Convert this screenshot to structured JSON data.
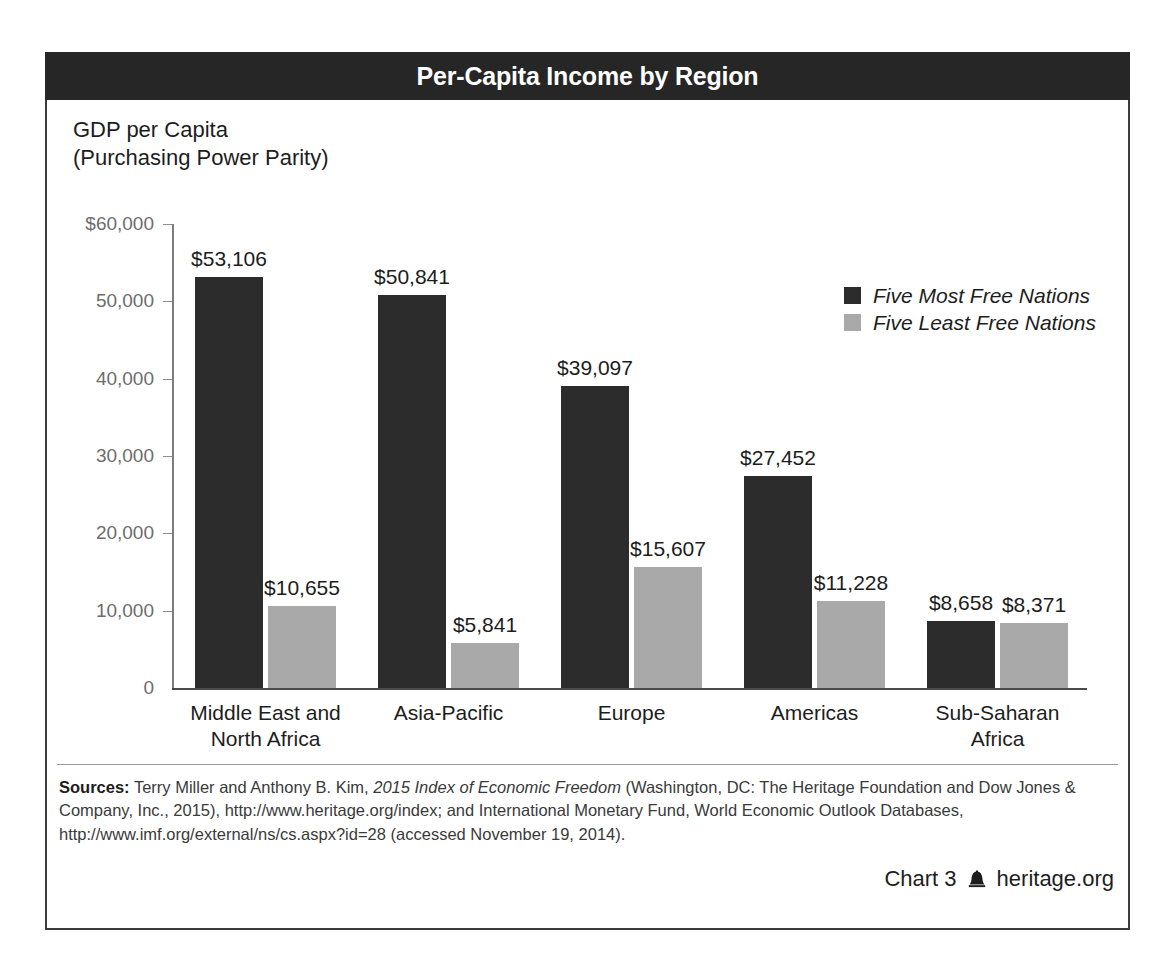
{
  "title": "Per-Capita Income by Region",
  "axis_title_line1": "GDP per Capita",
  "axis_title_line2": "(Purchasing Power Parity)",
  "legend": {
    "series1": "Five Most Free Nations",
    "series2": "Five Least Free Nations",
    "color1": "#2c2c2c",
    "color2": "#a9a9a9"
  },
  "footer": {
    "sources_label": "Sources:",
    "sources_text_1": " Terry Miller and Anthony B. Kim, ",
    "sources_italic_1": "2015 Index of Economic Freedom",
    "sources_text_2": " (Washington, DC: The Heritage Foundation and Dow Jones & Company, Inc., 2015), http://www.heritage.org/index; and International Monetary Fund, World Economic Outlook Databases, http://www.imf.org/external/ns/cs.aspx?id=28 (accessed November 19, 2014).",
    "chart_number": "Chart 3",
    "bell_icon": "liberty-bell-icon",
    "site": "heritage.org"
  },
  "chart_data": {
    "type": "bar",
    "title": "Per-Capita Income by Region",
    "xlabel": "",
    "ylabel": "GDP per Capita (Purchasing Power Parity)",
    "ylim": [
      0,
      60000
    ],
    "yticks": [
      0,
      10000,
      20000,
      30000,
      40000,
      50000,
      60000
    ],
    "ytick_labels": [
      "0",
      "10,000",
      "20,000",
      "30,000",
      "40,000",
      "50,000",
      "$60,000"
    ],
    "grid": false,
    "legend_position": "top-right",
    "categories": [
      "Middle East and North Africa",
      "Asia-Pacific",
      "Europe",
      "Americas",
      "Sub-Saharan Africa"
    ],
    "category_lines": [
      [
        "Middle East and",
        "North Africa"
      ],
      [
        "Asia-Pacific"
      ],
      [
        "Europe"
      ],
      [
        "Americas"
      ],
      [
        "Sub-Saharan",
        "Africa"
      ]
    ],
    "series": [
      {
        "name": "Five Most Free Nations",
        "color": "#2c2c2c",
        "values": [
          53106,
          50841,
          39097,
          27452,
          8658
        ],
        "labels": [
          "$53,106",
          "$50,841",
          "$39,097",
          "$27,452",
          "$8,658"
        ]
      },
      {
        "name": "Five Least Free Nations",
        "color": "#a9a9a9",
        "values": [
          10655,
          5841,
          15607,
          11228,
          8371
        ],
        "labels": [
          "$10,655",
          "$5,841",
          "$15,607",
          "$11,228",
          "$8,371"
        ]
      }
    ]
  }
}
